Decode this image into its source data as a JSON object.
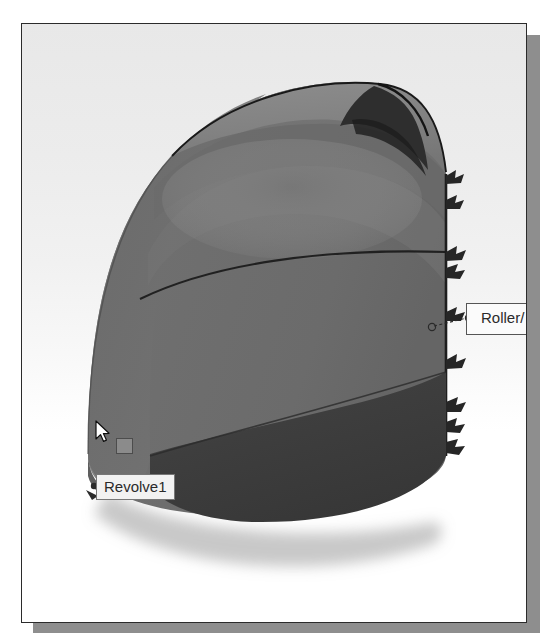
{
  "window": {
    "title": "3D Model Viewport",
    "background_top": "#e8e8e8",
    "background_bottom": "#ffffff",
    "border_color": "#2b2b2b",
    "shadow_color": "#8e8e8e"
  },
  "model": {
    "name": "Revolve1",
    "face_color_front": "#6e6e6e",
    "face_color_dome": "#787878",
    "face_color_dome_shadow": "#6a6a6a",
    "face_color_bottom": "#3c3c3c",
    "edge_color": "#1c1c1c"
  },
  "tooltips": {
    "revolve": {
      "label": "Revolve1",
      "icon": "feature-square-icon"
    },
    "roller": {
      "label": "Roller/",
      "full_label_clipped": true
    }
  },
  "constraints": {
    "type": "Roller/Slider",
    "symbol_count": 9,
    "edge": "right",
    "color": "#2a2a2a"
  },
  "cursor": {
    "type": "arrow-pointer",
    "color": "#ffffff",
    "outline": "#111111"
  }
}
